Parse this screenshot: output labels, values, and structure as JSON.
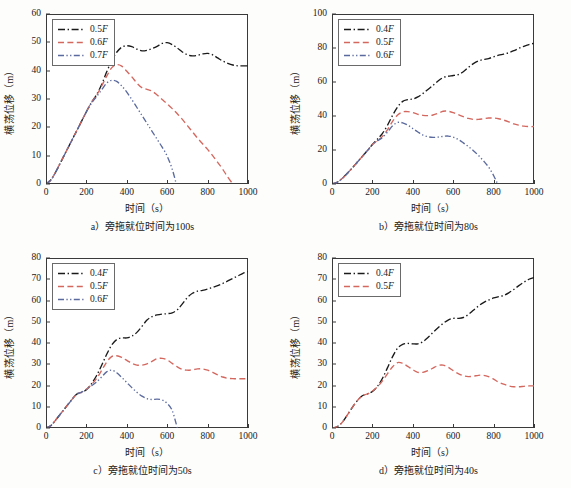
{
  "figure": {
    "title": "",
    "panel_count": 4,
    "background": "#ffffff",
    "axis_color": "#3a3a3a",
    "series_colors": {
      "black": "#1a1a1a",
      "red": "#d4685f",
      "blue": "#5b6a9e"
    }
  },
  "labels": {
    "xlabel": "时间（s）",
    "ylabel": "横荡位移（m）"
  },
  "chart_data": [
    {
      "id": "a",
      "type": "line",
      "title": "a）旁拖就位时间为100s",
      "caption": "a）旁拖就位时间为100s",
      "xlabel": "时间（s）",
      "ylabel": "横荡位移（m）",
      "xlim": [
        0,
        1000
      ],
      "ylim": [
        0,
        60
      ],
      "xticks": [
        0,
        200,
        400,
        600,
        800,
        1000
      ],
      "yticks": [
        0,
        10,
        20,
        30,
        40,
        50,
        60
      ],
      "grid": false,
      "legend_position": "upper-left",
      "series": [
        {
          "name": "0.5F",
          "color": "#1a1a1a",
          "style": "dash-dot",
          "x": [
            0,
            25,
            50,
            75,
            100,
            125,
            150,
            175,
            200,
            225,
            250,
            275,
            300,
            325,
            350,
            375,
            400,
            425,
            450,
            475,
            500,
            525,
            550,
            575,
            600,
            625,
            650,
            675,
            700,
            725,
            750,
            775,
            800,
            825,
            850,
            875,
            900,
            925,
            950,
            975,
            1000
          ],
          "y": [
            0,
            1.5,
            4.5,
            8.0,
            11.5,
            15.0,
            18.5,
            22.0,
            25.5,
            28.8,
            31.5,
            35.0,
            39.5,
            43.5,
            46.5,
            48.3,
            48.8,
            48.5,
            47.6,
            47.0,
            47.2,
            47.8,
            48.6,
            49.6,
            49.9,
            49.2,
            48.0,
            46.6,
            45.6,
            45.2,
            45.4,
            45.9,
            46.1,
            45.6,
            44.5,
            43.4,
            42.6,
            42.0,
            41.7,
            41.7,
            41.7
          ]
        },
        {
          "name": "0.6F",
          "color": "#d4685f",
          "style": "dashed",
          "x": [
            0,
            25,
            50,
            75,
            100,
            125,
            150,
            175,
            200,
            225,
            250,
            275,
            300,
            325,
            350,
            375,
            400,
            425,
            450,
            475,
            500,
            525,
            550,
            575,
            600,
            625,
            650,
            675,
            700,
            725,
            750,
            775,
            800,
            825,
            850,
            875,
            900,
            925
          ],
          "y": [
            0,
            1.5,
            4.5,
            8.0,
            11.5,
            15.0,
            18.5,
            22.0,
            25.5,
            28.8,
            31.3,
            34.5,
            38.0,
            41.0,
            42.1,
            41.6,
            39.8,
            37.8,
            35.6,
            34.0,
            33.4,
            32.8,
            31.4,
            29.8,
            28.3,
            26.6,
            24.8,
            22.8,
            20.6,
            18.4,
            16.2,
            14.2,
            12.2,
            10.0,
            7.6,
            5.2,
            2.4,
            0
          ]
        },
        {
          "name": "0.7F",
          "color": "#5b6a9e",
          "style": "dash-dot-dot",
          "x": [
            0,
            25,
            50,
            75,
            100,
            125,
            150,
            175,
            200,
            225,
            250,
            275,
            300,
            325,
            350,
            375,
            400,
            425,
            450,
            475,
            500,
            525,
            550,
            575,
            600,
            625,
            645
          ],
          "y": [
            0,
            1.5,
            4.5,
            8.0,
            11.5,
            15.0,
            18.5,
            22.0,
            25.5,
            28.5,
            30.8,
            33.2,
            35.6,
            36.6,
            36.2,
            34.6,
            32.4,
            29.8,
            27.0,
            24.2,
            21.4,
            18.6,
            15.8,
            13.0,
            9.8,
            5.2,
            0
          ]
        }
      ]
    },
    {
      "id": "b",
      "type": "line",
      "title": "b）旁拖就位时间为80s",
      "caption": "b）旁拖就位时间为80s",
      "xlabel": "时间（s）",
      "ylabel": "横荡位移（m）",
      "xlim": [
        0,
        1000
      ],
      "ylim": [
        0,
        100
      ],
      "xticks": [
        0,
        200,
        400,
        600,
        800,
        1000
      ],
      "yticks": [
        0,
        20,
        40,
        60,
        80,
        100
      ],
      "grid": false,
      "legend_position": "upper-left",
      "series": [
        {
          "name": "0.4F",
          "color": "#1a1a1a",
          "style": "dash-dot",
          "x": [
            0,
            25,
            50,
            75,
            100,
            125,
            150,
            175,
            200,
            225,
            250,
            275,
            300,
            325,
            350,
            375,
            400,
            425,
            450,
            475,
            500,
            525,
            550,
            575,
            600,
            625,
            650,
            675,
            700,
            725,
            750,
            775,
            800,
            825,
            850,
            875,
            900,
            925,
            950,
            975,
            1000
          ],
          "y": [
            0,
            1.0,
            3.2,
            6.2,
            9.4,
            12.8,
            16.2,
            19.6,
            23.2,
            26.4,
            29.8,
            34.6,
            40.4,
            45.4,
            48.6,
            49.6,
            50.0,
            51.2,
            53.2,
            55.6,
            58.0,
            60.6,
            62.6,
            63.4,
            63.8,
            64.4,
            66.0,
            68.6,
            70.8,
            72.4,
            73.2,
            73.8,
            74.8,
            75.8,
            76.4,
            77.2,
            78.4,
            79.8,
            81.0,
            82.0,
            82.8
          ]
        },
        {
          "name": "0.5F",
          "color": "#d4685f",
          "style": "dashed",
          "x": [
            0,
            25,
            50,
            75,
            100,
            125,
            150,
            175,
            200,
            225,
            250,
            275,
            300,
            325,
            350,
            375,
            400,
            425,
            450,
            475,
            500,
            525,
            550,
            575,
            600,
            625,
            650,
            675,
            700,
            725,
            750,
            775,
            800,
            825,
            850,
            875,
            900,
            925,
            950,
            975,
            1000
          ],
          "y": [
            0,
            1.0,
            3.2,
            6.2,
            9.4,
            12.8,
            16.2,
            19.6,
            23.2,
            25.6,
            28.0,
            32.0,
            36.8,
            40.6,
            42.4,
            42.6,
            42.0,
            41.0,
            40.4,
            40.2,
            40.6,
            41.6,
            42.8,
            42.8,
            42.0,
            40.8,
            39.6,
            38.6,
            38.0,
            38.0,
            38.4,
            38.8,
            38.8,
            38.4,
            37.6,
            36.6,
            35.4,
            34.6,
            34.0,
            33.8,
            33.8
          ]
        },
        {
          "name": "0.6F",
          "color": "#5b6a9e",
          "style": "dash-dot-dot",
          "x": [
            0,
            25,
            50,
            75,
            100,
            125,
            150,
            175,
            200,
            225,
            250,
            275,
            300,
            325,
            350,
            375,
            400,
            425,
            450,
            475,
            500,
            525,
            550,
            575,
            600,
            625,
            650,
            675,
            700,
            725,
            750,
            775,
            800,
            820
          ],
          "y": [
            0,
            1.0,
            3.2,
            6.2,
            9.4,
            12.8,
            16.2,
            19.6,
            23.2,
            25.4,
            27.4,
            30.6,
            34.2,
            36.2,
            36.0,
            34.6,
            32.6,
            30.6,
            28.8,
            27.8,
            27.4,
            27.6,
            28.0,
            28.2,
            27.6,
            26.2,
            24.2,
            22.0,
            19.6,
            16.8,
            13.6,
            10.0,
            5.0,
            0
          ]
        }
      ]
    },
    {
      "id": "c",
      "type": "line",
      "title": "c）旁拖就位时间为50s",
      "caption": "c）旁拖就位时间为50s",
      "xlabel": "时间（s）",
      "ylabel": "横荡位移（m）",
      "xlim": [
        0,
        1000
      ],
      "ylim": [
        0,
        80
      ],
      "xticks": [
        0,
        200,
        400,
        600,
        800,
        1000
      ],
      "yticks": [
        0,
        10,
        20,
        30,
        40,
        50,
        60,
        70,
        80
      ],
      "grid": false,
      "legend_position": "upper-left",
      "series": [
        {
          "name": "0.4F",
          "color": "#1a1a1a",
          "style": "dash-dot",
          "x": [
            0,
            25,
            50,
            75,
            100,
            125,
            150,
            175,
            200,
            225,
            250,
            275,
            300,
            325,
            350,
            375,
            400,
            425,
            450,
            475,
            500,
            525,
            550,
            575,
            600,
            625,
            650,
            675,
            700,
            725,
            750,
            775,
            800,
            825,
            850,
            875,
            900,
            925,
            950,
            975,
            1000
          ],
          "y": [
            0,
            1.2,
            4.0,
            7.0,
            10.0,
            13.0,
            15.8,
            16.8,
            18.0,
            20.8,
            24.6,
            29.4,
            34.6,
            39.0,
            41.6,
            42.4,
            42.4,
            43.2,
            45.0,
            47.8,
            50.8,
            52.4,
            53.2,
            53.6,
            53.8,
            54.2,
            55.6,
            58.4,
            61.4,
            63.4,
            64.4,
            64.8,
            65.4,
            66.2,
            67.0,
            68.0,
            69.2,
            70.4,
            71.6,
            72.8,
            73.6
          ]
        },
        {
          "name": "0.5F",
          "color": "#d4685f",
          "style": "dashed",
          "x": [
            0,
            25,
            50,
            75,
            100,
            125,
            150,
            175,
            200,
            225,
            250,
            275,
            300,
            325,
            350,
            375,
            400,
            425,
            450,
            475,
            500,
            525,
            550,
            575,
            600,
            625,
            650,
            675,
            700,
            725,
            750,
            775,
            800,
            825,
            850,
            875,
            900,
            925,
            950,
            975,
            1000
          ],
          "y": [
            0,
            1.2,
            4.0,
            7.0,
            10.0,
            13.0,
            15.8,
            16.8,
            18.2,
            20.4,
            23.2,
            27.0,
            31.0,
            33.6,
            34.0,
            33.2,
            31.8,
            30.4,
            29.6,
            29.6,
            30.2,
            31.4,
            32.6,
            32.8,
            32.0,
            30.4,
            28.8,
            27.6,
            27.2,
            27.4,
            27.8,
            27.8,
            27.2,
            26.2,
            25.0,
            24.0,
            23.4,
            23.2,
            23.2,
            23.2,
            23.2
          ]
        },
        {
          "name": "0.6F",
          "color": "#5b6a9e",
          "style": "dash-dot-dot",
          "x": [
            0,
            25,
            50,
            75,
            100,
            125,
            150,
            175,
            200,
            225,
            250,
            275,
            300,
            325,
            350,
            375,
            400,
            425,
            450,
            475,
            500,
            525,
            550,
            575,
            600,
            625,
            650
          ],
          "y": [
            0,
            1.2,
            4.0,
            7.0,
            10.0,
            13.0,
            15.8,
            16.8,
            18.2,
            19.8,
            21.6,
            24.0,
            26.4,
            27.2,
            26.0,
            23.8,
            21.4,
            19.0,
            16.8,
            15.0,
            13.8,
            13.4,
            13.6,
            13.2,
            11.6,
            8.2,
            0
          ]
        }
      ]
    },
    {
      "id": "d",
      "type": "line",
      "title": "d）旁拖就位时间为40s",
      "caption": "d）旁拖就位时间为40s",
      "xlabel": "时间（s）",
      "ylabel": "横荡位移（m）",
      "xlim": [
        0,
        1000
      ],
      "ylim": [
        0,
        80
      ],
      "xticks": [
        0,
        200,
        400,
        600,
        800,
        1000
      ],
      "yticks": [
        0,
        10,
        20,
        30,
        40,
        50,
        60,
        70,
        80
      ],
      "grid": false,
      "legend_position": "upper-left",
      "series": [
        {
          "name": "0.4F",
          "color": "#1a1a1a",
          "style": "dash-dot",
          "x": [
            0,
            25,
            50,
            75,
            100,
            125,
            150,
            175,
            200,
            225,
            250,
            275,
            300,
            325,
            350,
            375,
            400,
            425,
            450,
            475,
            500,
            525,
            550,
            575,
            600,
            625,
            650,
            675,
            700,
            725,
            750,
            775,
            800,
            825,
            850,
            875,
            900,
            925,
            950,
            975,
            1000
          ],
          "y": [
            0,
            0.6,
            2.6,
            6.0,
            9.6,
            12.8,
            15.2,
            16.0,
            17.2,
            19.6,
            23.4,
            28.4,
            33.6,
            37.6,
            39.4,
            39.8,
            39.6,
            39.6,
            40.6,
            42.6,
            45.0,
            47.2,
            49.2,
            50.8,
            51.6,
            51.6,
            52.0,
            53.4,
            55.4,
            57.4,
            59.0,
            60.2,
            61.2,
            61.8,
            62.4,
            63.6,
            65.2,
            67.0,
            68.6,
            70.0,
            70.8
          ]
        },
        {
          "name": "0.5F",
          "color": "#d4685f",
          "style": "dashed",
          "x": [
            0,
            25,
            50,
            75,
            100,
            125,
            150,
            175,
            200,
            225,
            250,
            275,
            300,
            325,
            350,
            375,
            400,
            425,
            450,
            475,
            500,
            525,
            550,
            575,
            600,
            625,
            650,
            675,
            700,
            725,
            750,
            775,
            800,
            825,
            850,
            875,
            900,
            925,
            950,
            975,
            1000
          ],
          "y": [
            0,
            0.6,
            2.6,
            6.0,
            9.6,
            12.8,
            15.2,
            16.0,
            17.4,
            19.4,
            22.2,
            25.6,
            28.8,
            30.8,
            30.4,
            29.0,
            27.4,
            26.2,
            26.2,
            27.0,
            28.2,
            29.4,
            29.6,
            28.6,
            27.0,
            25.6,
            24.6,
            24.2,
            24.4,
            24.8,
            24.8,
            24.2,
            23.0,
            21.6,
            20.6,
            19.8,
            19.4,
            19.4,
            19.6,
            19.8,
            19.8
          ]
        }
      ]
    }
  ]
}
